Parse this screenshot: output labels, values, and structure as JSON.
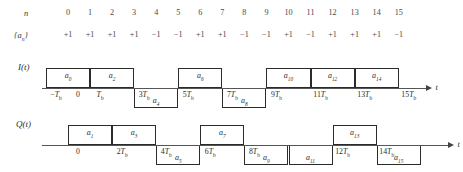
{
  "figure": {
    "kind": "qpsk-offset-waveform-timing-diagram",
    "axis_variable": "t",
    "bit_period_symbol": "T",
    "bit_period_subscript": "b"
  },
  "index_row": {
    "label": "n",
    "values": [
      "0",
      "1",
      "2",
      "3",
      "4",
      "5",
      "6",
      "7",
      "8",
      "9",
      "10",
      "11",
      "12",
      "13",
      "14",
      "15"
    ]
  },
  "bit_row": {
    "label": "{a",
    "label_sub": "n",
    "label_tail": "}",
    "values": [
      "+1",
      "+1",
      "+1",
      "+1",
      "−1",
      "−1",
      "+1",
      "+1",
      "−1",
      "−1",
      "+1",
      "−1",
      "+1",
      "+1",
      "+1",
      "−1"
    ]
  },
  "inphase": {
    "name": "I(t)",
    "axis_label": "t",
    "pulses": [
      {
        "symbol": "a",
        "sub": "0",
        "start_Tb": -1,
        "end_Tb": 1,
        "level": "up"
      },
      {
        "symbol": "a",
        "sub": "2",
        "start_Tb": 1,
        "end_Tb": 3,
        "level": "up"
      },
      {
        "symbol": "a",
        "sub": "4",
        "start_Tb": 3,
        "end_Tb": 5,
        "level": "down"
      },
      {
        "symbol": "a",
        "sub": "6",
        "start_Tb": 5,
        "end_Tb": 7,
        "level": "up"
      },
      {
        "symbol": "a",
        "sub": "8",
        "start_Tb": 7,
        "end_Tb": 9,
        "level": "down"
      },
      {
        "symbol": "a",
        "sub": "10",
        "start_Tb": 9,
        "end_Tb": 11,
        "level": "up"
      },
      {
        "symbol": "a",
        "sub": "12",
        "start_Tb": 11,
        "end_Tb": 13,
        "level": "up"
      },
      {
        "symbol": "a",
        "sub": "14",
        "start_Tb": 13,
        "end_Tb": 15,
        "level": "up"
      }
    ],
    "ticks": [
      {
        "text": "−T",
        "sub": "b",
        "at_Tb": -1
      },
      {
        "text": "0",
        "sub": "",
        "at_Tb": 0
      },
      {
        "text": "T",
        "sub": "b",
        "at_Tb": 1
      },
      {
        "text": "3T",
        "sub": "b",
        "at_Tb": 3
      },
      {
        "text": "5T",
        "sub": "b",
        "at_Tb": 5
      },
      {
        "text": "7T",
        "sub": "b",
        "at_Tb": 7
      },
      {
        "text": "9T",
        "sub": "b",
        "at_Tb": 9
      },
      {
        "text": "11T",
        "sub": "b",
        "at_Tb": 11
      },
      {
        "text": "13T",
        "sub": "b",
        "at_Tb": 13
      },
      {
        "text": "15T",
        "sub": "b",
        "at_Tb": 15
      }
    ]
  },
  "quadrature": {
    "name": "Q(t)",
    "axis_label": "t",
    "pulses": [
      {
        "symbol": "a",
        "sub": "1",
        "start_Tb": 0,
        "end_Tb": 2,
        "level": "up"
      },
      {
        "symbol": "a",
        "sub": "3",
        "start_Tb": 2,
        "end_Tb": 4,
        "level": "up"
      },
      {
        "symbol": "a",
        "sub": "5",
        "start_Tb": 4,
        "end_Tb": 6,
        "level": "down"
      },
      {
        "symbol": "a",
        "sub": "7",
        "start_Tb": 6,
        "end_Tb": 8,
        "level": "up"
      },
      {
        "symbol": "a",
        "sub": "9",
        "start_Tb": 8,
        "end_Tb": 10,
        "level": "down"
      },
      {
        "symbol": "a",
        "sub": "11",
        "start_Tb": 10,
        "end_Tb": 12,
        "level": "down"
      },
      {
        "symbol": "a",
        "sub": "13",
        "start_Tb": 12,
        "end_Tb": 14,
        "level": "up"
      },
      {
        "symbol": "a",
        "sub": "15",
        "start_Tb": 14,
        "end_Tb": 16,
        "level": "down"
      }
    ],
    "ticks": [
      {
        "text": "0",
        "sub": "",
        "at_Tb": 0
      },
      {
        "text": "2T",
        "sub": "b",
        "at_Tb": 2
      },
      {
        "text": "4T",
        "sub": "b",
        "at_Tb": 4
      },
      {
        "text": "6T",
        "sub": "b",
        "at_Tb": 6
      },
      {
        "text": "8T",
        "sub": "b",
        "at_Tb": 8
      },
      {
        "text": "12T",
        "sub": "b",
        "at_Tb": 12
      },
      {
        "text": "14T",
        "sub": "b",
        "at_Tb": 14
      }
    ]
  },
  "colors": {
    "ink": "#2b2b2b",
    "axis": "#555555",
    "muted": "#4a4a4a",
    "background": "#ffffff"
  }
}
